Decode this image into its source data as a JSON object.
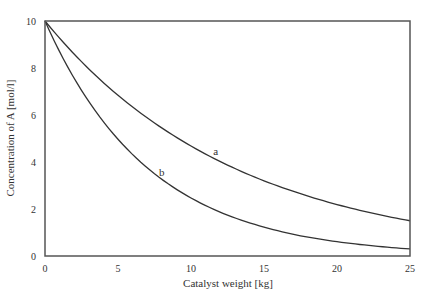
{
  "chart_data": {
    "type": "line",
    "title": "",
    "xlabel": "Catalyst weight [kg]",
    "ylabel": "Concentration of A [mol/l]",
    "xlim": [
      0,
      25
    ],
    "ylim": [
      0,
      10
    ],
    "xticks": [
      0,
      5,
      10,
      15,
      20,
      25
    ],
    "yticks": [
      0,
      2,
      4,
      6,
      8,
      10
    ],
    "grid": false,
    "legend": "none (curves labeled inline)",
    "x": [
      0,
      2.5,
      5,
      7.5,
      10,
      12.5,
      15,
      17.5,
      20,
      22.5,
      25
    ],
    "series": [
      {
        "name": "a",
        "label_position": {
          "x": 11.7,
          "y": 4.3
        },
        "values": [
          10.0,
          8.27,
          6.84,
          5.66,
          4.68,
          3.87,
          3.2,
          2.65,
          2.19,
          1.81,
          1.5
        ]
      },
      {
        "name": "b",
        "label_position": {
          "x": 8.0,
          "y": 3.4
        },
        "values": [
          10.0,
          7.05,
          4.97,
          3.5,
          2.47,
          1.74,
          1.23,
          0.86,
          0.61,
          0.43,
          0.3
        ]
      }
    ]
  },
  "colors": {
    "frame": "#555555",
    "curve": "#333333",
    "text": "#333333"
  }
}
